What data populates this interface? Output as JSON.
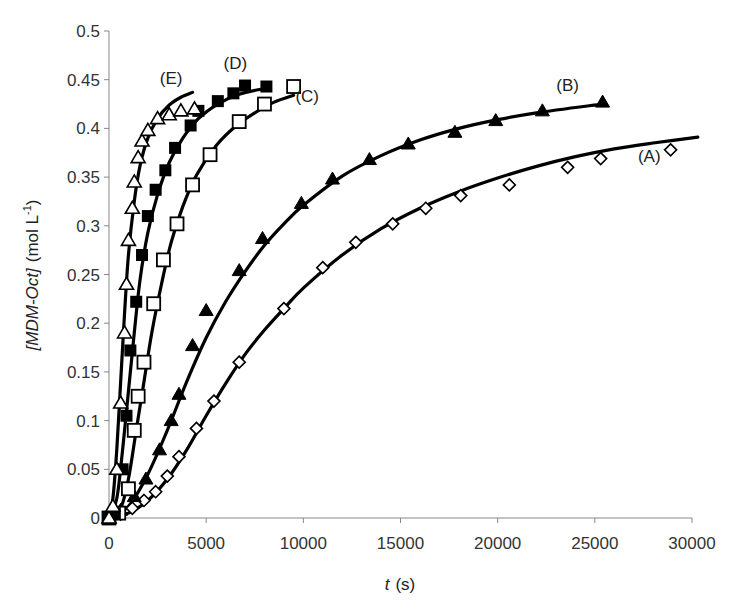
{
  "chart_data": {
    "type": "scatter",
    "title": "",
    "xlabel": "t (s)",
    "xlabel_italic_part": "t",
    "xlabel_unit": "(s)",
    "ylabel": "[MDM-Oct] (mol L-1)",
    "ylabel_italic_part": "[MDM-Oct]",
    "ylabel_unit": "(mol L",
    "ylabel_superscript": "-1",
    "ylabel_close": ")",
    "xlim": [
      0,
      30000
    ],
    "ylim": [
      0,
      0.5
    ],
    "x_ticks": [
      "0",
      "5000",
      "10000",
      "15000",
      "20000",
      "25000",
      "30000"
    ],
    "x_tick_values": [
      0,
      5000,
      10000,
      15000,
      20000,
      25000,
      30000
    ],
    "y_ticks": [
      "0",
      "0.05",
      "0.1",
      "0.15",
      "0.2",
      "0.25",
      "0.3",
      "0.35",
      "0.4",
      "0.45",
      "0.5"
    ],
    "y_tick_values": [
      0,
      0.05,
      0.1,
      0.15,
      0.2,
      0.25,
      0.3,
      0.35,
      0.4,
      0.45,
      0.5
    ],
    "grid": false,
    "legend": "none (inline labels)",
    "series": [
      {
        "name": "(A)",
        "marker": "open-diamond",
        "label_pos": [
          27800,
          0.365
        ],
        "points": [
          [
            0,
            0
          ],
          [
            600,
            0.004
          ],
          [
            1200,
            0.01
          ],
          [
            1800,
            0.018
          ],
          [
            2400,
            0.027
          ],
          [
            3000,
            0.043
          ],
          [
            3600,
            0.063
          ],
          [
            4500,
            0.092
          ],
          [
            5400,
            0.12
          ],
          [
            6700,
            0.16
          ],
          [
            9000,
            0.215
          ],
          [
            11000,
            0.257
          ],
          [
            12700,
            0.283
          ],
          [
            14600,
            0.302
          ],
          [
            16300,
            0.318
          ],
          [
            18100,
            0.331
          ],
          [
            20600,
            0.342
          ],
          [
            23600,
            0.36
          ],
          [
            25300,
            0.369
          ],
          [
            28900,
            0.378
          ]
        ],
        "fit": [
          [
            0,
            0
          ],
          [
            1000,
            0.005
          ],
          [
            2000,
            0.018
          ],
          [
            3000,
            0.04
          ],
          [
            4000,
            0.07
          ],
          [
            5000,
            0.105
          ],
          [
            6000,
            0.138
          ],
          [
            7000,
            0.168
          ],
          [
            8000,
            0.193
          ],
          [
            9000,
            0.215
          ],
          [
            10000,
            0.236
          ],
          [
            12000,
            0.27
          ],
          [
            14000,
            0.297
          ],
          [
            16000,
            0.318
          ],
          [
            18000,
            0.335
          ],
          [
            20000,
            0.349
          ],
          [
            22000,
            0.361
          ],
          [
            24000,
            0.371
          ],
          [
            26000,
            0.379
          ],
          [
            28000,
            0.385
          ],
          [
            30300,
            0.391
          ]
        ]
      },
      {
        "name": "(B)",
        "marker": "filled-triangle",
        "label_pos": [
          23600,
          0.438
        ],
        "points": [
          [
            0,
            0
          ],
          [
            600,
            0.008
          ],
          [
            1300,
            0.022
          ],
          [
            1900,
            0.04
          ],
          [
            2600,
            0.07
          ],
          [
            3200,
            0.1
          ],
          [
            3600,
            0.127
          ],
          [
            4300,
            0.177
          ],
          [
            5000,
            0.213
          ],
          [
            6700,
            0.254
          ],
          [
            7900,
            0.287
          ],
          [
            9900,
            0.323
          ],
          [
            11500,
            0.348
          ],
          [
            13400,
            0.368
          ],
          [
            15400,
            0.384
          ],
          [
            17800,
            0.396
          ],
          [
            19900,
            0.408
          ],
          [
            22300,
            0.418
          ],
          [
            25400,
            0.427
          ]
        ],
        "fit": [
          [
            0,
            0
          ],
          [
            1000,
            0.012
          ],
          [
            2000,
            0.045
          ],
          [
            3000,
            0.09
          ],
          [
            4000,
            0.14
          ],
          [
            5000,
            0.185
          ],
          [
            6000,
            0.222
          ],
          [
            7000,
            0.253
          ],
          [
            8000,
            0.28
          ],
          [
            9000,
            0.302
          ],
          [
            10000,
            0.321
          ],
          [
            12000,
            0.351
          ],
          [
            14000,
            0.372
          ],
          [
            16000,
            0.388
          ],
          [
            18000,
            0.4
          ],
          [
            20000,
            0.409
          ],
          [
            22000,
            0.416
          ],
          [
            25400,
            0.425
          ]
        ]
      },
      {
        "name": "(C)",
        "marker": "open-square",
        "label_pos": [
          10200,
          0.427
        ],
        "points": [
          [
            0,
            0
          ],
          [
            500,
            0.005
          ],
          [
            1000,
            0.03
          ],
          [
            1300,
            0.09
          ],
          [
            1500,
            0.125
          ],
          [
            1800,
            0.16
          ],
          [
            2300,
            0.22
          ],
          [
            2800,
            0.265
          ],
          [
            3500,
            0.302
          ],
          [
            4300,
            0.342
          ],
          [
            5200,
            0.373
          ],
          [
            6700,
            0.407
          ],
          [
            8000,
            0.425
          ],
          [
            9500,
            0.443
          ]
        ],
        "fit": [
          [
            0,
            0
          ],
          [
            600,
            0.01
          ],
          [
            1000,
            0.04
          ],
          [
            1400,
            0.09
          ],
          [
            1800,
            0.14
          ],
          [
            2200,
            0.19
          ],
          [
            2700,
            0.24
          ],
          [
            3200,
            0.283
          ],
          [
            3800,
            0.32
          ],
          [
            4500,
            0.352
          ],
          [
            5500,
            0.382
          ],
          [
            6500,
            0.402
          ],
          [
            7500,
            0.416
          ],
          [
            8500,
            0.427
          ],
          [
            9500,
            0.434
          ]
        ]
      },
      {
        "name": "(D)",
        "marker": "filled-square",
        "label_pos": [
          6500,
          0.461
        ],
        "points": [
          [
            0,
            0
          ],
          [
            300,
            0.005
          ],
          [
            700,
            0.05
          ],
          [
            900,
            0.105
          ],
          [
            1100,
            0.172
          ],
          [
            1400,
            0.222
          ],
          [
            1700,
            0.27
          ],
          [
            2000,
            0.31
          ],
          [
            2400,
            0.337
          ],
          [
            2900,
            0.357
          ],
          [
            3400,
            0.38
          ],
          [
            4200,
            0.403
          ],
          [
            4600,
            0.418
          ],
          [
            5600,
            0.428
          ],
          [
            6400,
            0.436
          ],
          [
            7000,
            0.444
          ],
          [
            8100,
            0.443
          ]
        ],
        "fit": [
          [
            0,
            0
          ],
          [
            400,
            0.02
          ],
          [
            700,
            0.07
          ],
          [
            1000,
            0.13
          ],
          [
            1300,
            0.19
          ],
          [
            1600,
            0.245
          ],
          [
            2000,
            0.293
          ],
          [
            2500,
            0.332
          ],
          [
            3100,
            0.365
          ],
          [
            3800,
            0.39
          ],
          [
            4600,
            0.41
          ],
          [
            5600,
            0.425
          ],
          [
            6700,
            0.435
          ],
          [
            8000,
            0.441
          ]
        ]
      },
      {
        "name": "(E)",
        "marker": "open-triangle",
        "label_pos": [
          3200,
          0.446
        ],
        "points": [
          [
            0,
            0
          ],
          [
            200,
            0.012
          ],
          [
            400,
            0.05
          ],
          [
            600,
            0.118
          ],
          [
            800,
            0.19
          ],
          [
            900,
            0.24
          ],
          [
            1000,
            0.285
          ],
          [
            1200,
            0.318
          ],
          [
            1300,
            0.345
          ],
          [
            1500,
            0.37
          ],
          [
            1700,
            0.387
          ],
          [
            2000,
            0.398
          ],
          [
            2500,
            0.41
          ],
          [
            3100,
            0.414
          ],
          [
            3700,
            0.418
          ],
          [
            4400,
            0.42
          ]
        ],
        "fit": [
          [
            0,
            0
          ],
          [
            200,
            0.02
          ],
          [
            400,
            0.07
          ],
          [
            600,
            0.14
          ],
          [
            800,
            0.21
          ],
          [
            1000,
            0.27
          ],
          [
            1300,
            0.325
          ],
          [
            1600,
            0.362
          ],
          [
            2000,
            0.39
          ],
          [
            2500,
            0.41
          ],
          [
            3100,
            0.424
          ],
          [
            3700,
            0.432
          ],
          [
            4300,
            0.437
          ]
        ]
      }
    ]
  }
}
